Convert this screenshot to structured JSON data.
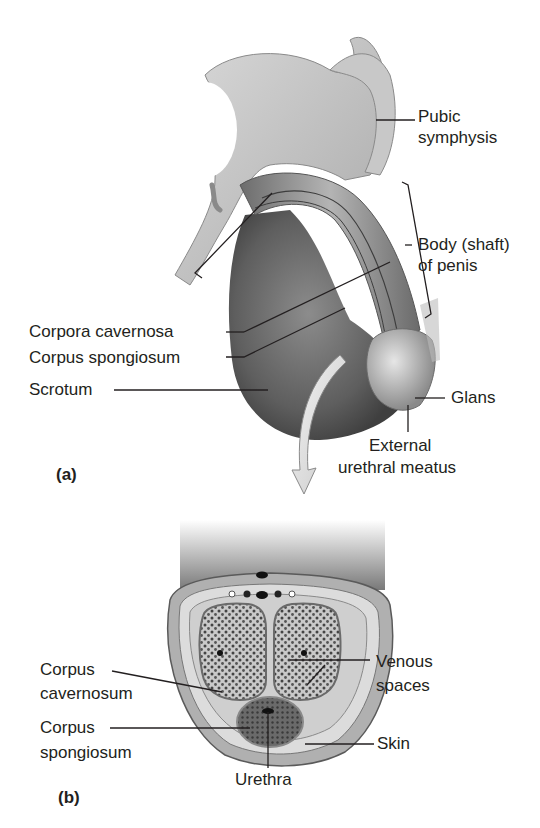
{
  "figure": {
    "panel_a": {
      "tag": "(a)",
      "labels": {
        "pubic_symphysis": [
          "Pubic",
          "symphysis"
        ],
        "body_shaft": [
          "Body (shaft)",
          "of penis"
        ],
        "corpora_cavernosa": "Corpora cavernosa",
        "corpus_spongiosum": "Corpus spongiosum",
        "scrotum": "Scrotum",
        "glans": "Glans",
        "external_urethral_meatus": [
          "External",
          "urethral meatus"
        ]
      }
    },
    "panel_b": {
      "tag": "(b)",
      "labels": {
        "corpus_cavernosum": [
          "Corpus",
          "cavernosum"
        ],
        "corpus_spongiosum": [
          "Corpus",
          "spongiosum"
        ],
        "venous_spaces": [
          "Venous",
          "spaces"
        ],
        "skin": "Skin",
        "urethra": "Urethra"
      }
    },
    "colors": {
      "label_text": "#231f20",
      "leader_line": "#231f20",
      "tissue_dark": "#5a5a5a",
      "tissue_mid": "#9a9a9a",
      "tissue_light": "#d4d4d4"
    }
  }
}
